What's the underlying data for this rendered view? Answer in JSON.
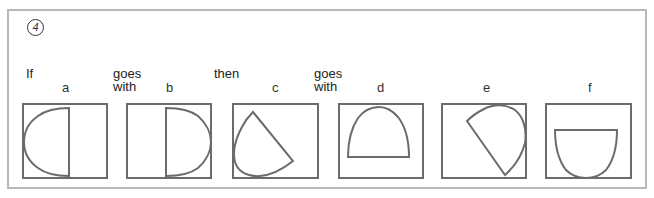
{
  "question": {
    "number": "4",
    "words": {
      "if": "If",
      "goes_with_1": [
        "goes",
        "with"
      ],
      "then": "then",
      "goes_with_2": [
        "goes",
        "with"
      ]
    },
    "options": [
      {
        "label": "a",
        "shape": "half-ellipse-facing-left"
      },
      {
        "label": "b",
        "shape": "half-ellipse-facing-right"
      },
      {
        "label": "c",
        "shape": "half-ellipse-rotated-down-left"
      },
      {
        "label": "d",
        "shape": "half-ellipse-facing-up"
      },
      {
        "label": "e",
        "shape": "half-ellipse-rotated-up-right"
      },
      {
        "label": "f",
        "shape": "half-ellipse-facing-down"
      }
    ]
  },
  "colors": {
    "frame_border": "#b8b8b8",
    "box_border": "#6b6b6b",
    "shape_stroke": "#6b6b6b"
  }
}
